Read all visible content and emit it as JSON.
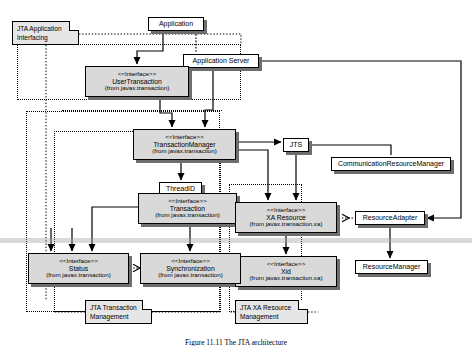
{
  "figure": {
    "caption": "Figure 11.11   The JTA architecture",
    "background": "#ffffff",
    "node_fill": "#d9d9d9",
    "note_fill": "#e6e6e6",
    "stroke": "#000000"
  },
  "nodes": {
    "application": {
      "name": "Application",
      "x": 148,
      "y": 17,
      "w": 56,
      "h": 14,
      "style": "plain"
    },
    "application_server": {
      "name": "Application Server",
      "x": 183,
      "y": 54,
      "w": 76,
      "h": 14,
      "style": "plain"
    },
    "user_transaction": {
      "stereotype": "<<Interface>>",
      "name": "UserTransaction",
      "package": "(from javax.transaction)",
      "x": 85,
      "y": 66,
      "w": 104,
      "h": 31,
      "style": "iface"
    },
    "transaction_manager": {
      "stereotype": "<<Interface>>",
      "name": "TransactionManager",
      "package": "(from javax.transaction)",
      "x": 133,
      "y": 129,
      "w": 103,
      "h": 31,
      "style": "iface"
    },
    "jts": {
      "name": "JTS",
      "x": 283,
      "y": 138,
      "w": 26,
      "h": 14,
      "style": "plain"
    },
    "communication_resource_manager": {
      "name": "CommunicationResourceManager",
      "x": 331,
      "y": 157,
      "w": 120,
      "h": 14,
      "style": "plain"
    },
    "threadid": {
      "name": "ThreadID",
      "x": 159,
      "y": 182,
      "w": 43,
      "h": 13,
      "style": "plain"
    },
    "transaction": {
      "stereotype": "<<Interface>>",
      "name": "Transaction",
      "package": "(from javax.transaction)",
      "x": 138,
      "y": 193,
      "w": 99,
      "h": 31,
      "style": "iface"
    },
    "xa_resource": {
      "stereotype": "<<Interface>>",
      "name": "XA Resource",
      "package": "(from javax.transaction.xa)",
      "x": 235,
      "y": 202,
      "w": 102,
      "h": 31,
      "style": "iface"
    },
    "xid": {
      "stereotype": "<<Interface>>",
      "name": "Xid",
      "package": "(from javax.transaction.xa)",
      "x": 235,
      "y": 256,
      "w": 102,
      "h": 31,
      "style": "iface"
    },
    "resource_adapter": {
      "name": "ResourceAdapter",
      "x": 355,
      "y": 211,
      "w": 70,
      "h": 14,
      "style": "plain"
    },
    "resource_manager": {
      "name": "ResourceManager",
      "x": 355,
      "y": 260,
      "w": 73,
      "h": 14,
      "style": "plain"
    },
    "status": {
      "stereotype": "<<Interface>>",
      "name": "Status",
      "package": "(from javax.transaction)",
      "x": 28,
      "y": 253,
      "w": 101,
      "h": 31,
      "style": "iface"
    },
    "synchronization": {
      "stereotype": "<<Interface>>",
      "name": "Synchronization",
      "package": "(from javax.transaction)",
      "x": 140,
      "y": 253,
      "w": 101,
      "h": 31,
      "style": "iface"
    }
  },
  "notes": [
    {
      "key": "jta_application_interfacing",
      "line1": "JTA Application",
      "line2": "Interfacing",
      "x": 12,
      "y": 21,
      "w": 67,
      "h": 24
    },
    {
      "key": "jta_transaction_management",
      "line1": "JTA Transaction",
      "line2": "Management",
      "x": 85,
      "y": 300,
      "w": 67,
      "h": 24
    },
    {
      "key": "jta_xa_resource_management",
      "line1": "JTA XA Resource",
      "line2": "Management",
      "x": 235,
      "y": 300,
      "w": 73,
      "h": 24
    }
  ],
  "regions": [
    {
      "key": "application-interfacing-region",
      "x": 17,
      "y": 44,
      "w": 224,
      "h": 56
    },
    {
      "key": "transaction-management-region",
      "x": 26,
      "y": 111,
      "w": 194,
      "h": 201
    },
    {
      "key": "transaction-management-inner-region",
      "x": 54,
      "y": 131,
      "w": 167,
      "h": 181
    },
    {
      "key": "server-region",
      "x": 62,
      "y": 105,
      "w": 160,
      "h": 8
    },
    {
      "key": "xa-resource-region",
      "x": 229,
      "y": 184,
      "w": 73,
      "h": 128
    }
  ],
  "edges": [
    {
      "from": "application",
      "to": "user_transaction",
      "kind": "solid-arrow"
    },
    {
      "from": "application",
      "to": "application_server",
      "kind": "dotted"
    },
    {
      "from": "application_server",
      "to": "transaction_manager",
      "kind": "solid-arrow"
    },
    {
      "from": "user_transaction",
      "to": "transaction_manager",
      "kind": "solid-arrow"
    },
    {
      "from": "transaction_manager",
      "to": "jts",
      "kind": "solid-arrow"
    },
    {
      "from": "jts",
      "to": "communication_resource_manager",
      "kind": "solid"
    },
    {
      "from": "jts",
      "to": "xa_resource",
      "kind": "solid-arrow"
    },
    {
      "from": "transaction_manager",
      "to": "threadid",
      "kind": "solid-arrow"
    },
    {
      "from": "transaction_manager",
      "to": "xa_resource",
      "kind": "solid-arrow"
    },
    {
      "from": "transaction",
      "to": "synchronization",
      "kind": "solid-arrow"
    },
    {
      "from": "transaction",
      "to": "status",
      "kind": "solid-arrow"
    },
    {
      "from": "synchronization",
      "to": "status",
      "kind": "dotted-hollow-arrow"
    },
    {
      "from": "xa_resource",
      "to": "xid",
      "kind": "solid-arrow"
    },
    {
      "from": "resource_adapter",
      "to": "xa_resource",
      "kind": "dotted-hollow-arrow"
    },
    {
      "from": "resource_adapter",
      "to": "resource_manager",
      "kind": "solid-arrow"
    },
    {
      "from": "application_server",
      "to": "resource_adapter",
      "kind": "solid-arrow"
    }
  ]
}
